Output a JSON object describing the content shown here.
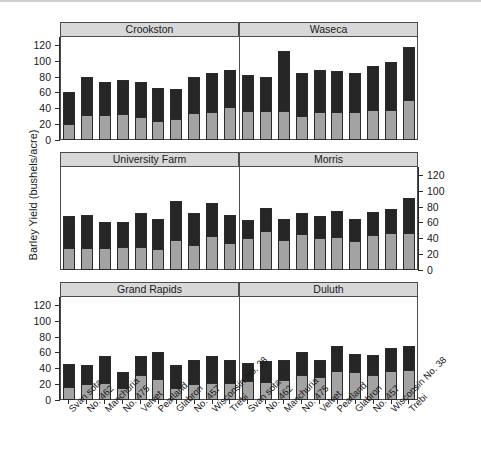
{
  "axis": {
    "y_title": "Barley Yield (bushels/acre)",
    "y_ticks": [
      "0",
      "20",
      "40",
      "60",
      "80",
      "100",
      "120"
    ],
    "y_min": 0,
    "y_max": 130
  },
  "varieties": [
    "Svan sota",
    "No. 462",
    "Manchuria",
    "No. 475",
    "Velvet",
    "Peatland",
    "Glabron",
    "No. 457",
    "Wisconsin No. 38",
    "Trebi"
  ],
  "colors": {
    "segment_light": "#a3a3a3",
    "segment_dark": "#262626",
    "strip_background": "#d8d8d8",
    "frame": "#4d4d4d",
    "text": "#1a1a1a"
  },
  "panels": [
    {
      "title": "Crookston",
      "row": 0,
      "col": 0
    },
    {
      "title": "Waseca",
      "row": 0,
      "col": 1
    },
    {
      "title": "University Farm",
      "row": 1,
      "col": 0
    },
    {
      "title": "Morris",
      "row": 1,
      "col": 1
    },
    {
      "title": "Grand Rapids",
      "row": 2,
      "col": 0
    },
    {
      "title": "Duluth",
      "row": 2,
      "col": 1
    }
  ],
  "chart_data": {
    "type": "bar",
    "stacked": true,
    "title": "",
    "xlabel": "",
    "ylabel": "Barley Yield (bushels/acre)",
    "ylim": [
      0,
      130
    ],
    "yticks": [
      0,
      20,
      40,
      60,
      80,
      100,
      120
    ],
    "grid": false,
    "legend": "none",
    "categories": [
      "Svan sota",
      "No. 462",
      "Manchuria",
      "No. 475",
      "Velvet",
      "Peatland",
      "Glabron",
      "No. 457",
      "Wisconsin No. 38",
      "Trebi"
    ],
    "panel_layout": {
      "rows": 3,
      "cols": 2,
      "order": [
        "Crookston",
        "Waseca",
        "University Farm",
        "Morris",
        "Grand Rapids",
        "Duluth"
      ]
    },
    "series": [
      {
        "name": "lower-segment",
        "color": "#a3a3a3"
      },
      {
        "name": "upper-segment",
        "color": "#262626"
      }
    ],
    "panels": [
      {
        "name": "Crookston",
        "lower": [
          20,
          31,
          32,
          33,
          29,
          24,
          26,
          34,
          35,
          42
        ],
        "upper": [
          41,
          48,
          41,
          43,
          44,
          42,
          38,
          46,
          50,
          47
        ],
        "total": [
          61,
          79,
          73,
          76,
          73,
          66,
          64,
          80,
          85,
          89
        ]
      },
      {
        "name": "Waseca",
        "lower": [
          36,
          36,
          37,
          30,
          35,
          35,
          35,
          38,
          38,
          51,
          47
        ],
        "upper": [
          46,
          44,
          75,
          54,
          54,
          52,
          49,
          56,
          60,
          67,
          65
        ],
        "total": [
          82,
          80,
          112,
          84,
          89,
          87,
          84,
          94,
          98,
          118,
          112
        ]
      },
      {
        "name": "University Farm",
        "lower": [
          28,
          28,
          28,
          29,
          29,
          27,
          38,
          31,
          43,
          34
        ],
        "upper": [
          40,
          41,
          32,
          32,
          43,
          38,
          49,
          41,
          42,
          36
        ],
        "total": [
          68,
          69,
          60,
          61,
          72,
          65,
          87,
          72,
          85,
          70
        ]
      },
      {
        "name": "Morris",
        "lower": [
          41,
          49,
          38,
          45,
          40,
          42,
          36,
          44,
          47,
          47
        ],
        "upper": [
          22,
          29,
          26,
          27,
          28,
          32,
          29,
          29,
          30,
          44
        ],
        "total": [
          63,
          78,
          64,
          72,
          68,
          74,
          65,
          73,
          77,
          91
        ]
      },
      {
        "name": "Grand Rapids",
        "lower": [
          16,
          20,
          22,
          15,
          31,
          26,
          15,
          20,
          21,
          21
        ],
        "upper": [
          30,
          24,
          34,
          20,
          24,
          35,
          29,
          31,
          34,
          29
        ],
        "total": [
          46,
          44,
          56,
          35,
          55,
          61,
          44,
          51,
          55,
          50
        ]
      },
      {
        "name": "Duluth",
        "lower": [
          24,
          23,
          25,
          32,
          29,
          37,
          35,
          32,
          36,
          38
        ],
        "upper": [
          23,
          26,
          25,
          28,
          21,
          31,
          23,
          25,
          30,
          30
        ],
        "total": [
          47,
          49,
          50,
          60,
          50,
          68,
          58,
          57,
          66,
          68
        ]
      }
    ]
  }
}
